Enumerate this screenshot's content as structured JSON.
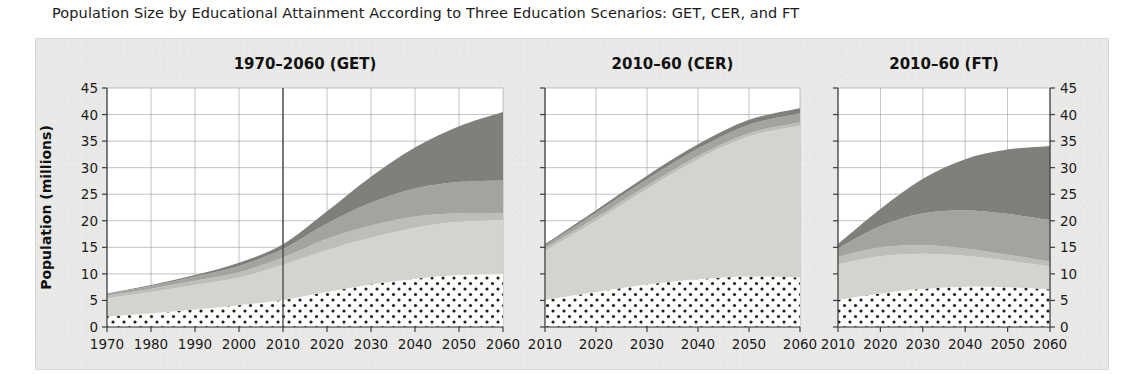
{
  "figure": {
    "title": "Population Size by Educational Attainment According to Three Education Scenarios: GET, CER, and FT",
    "ylabel": "Population (millions)",
    "background_color": "#e9e9e7",
    "frame_color": "#d6d6d3",
    "grid_color": "#9a9a9a"
  },
  "panels": [
    {
      "id": "get",
      "title": "1970–2060 (GET)"
    },
    {
      "id": "cer",
      "title": "2010–60 (CER)"
    },
    {
      "id": "ft",
      "title": "2010–60 (FT)"
    }
  ],
  "axis": {
    "y_ticks": [
      "0",
      "5",
      "10",
      "15",
      "20",
      "25",
      "30",
      "35",
      "40",
      "45"
    ],
    "x_ticks_panel1": [
      "1970",
      "1980",
      "1990",
      "2000",
      "2010",
      "2020",
      "2030",
      "2040",
      "2050",
      "2060"
    ],
    "x_ticks_panel2": [
      "2010",
      "2020",
      "2030",
      "2040",
      "2050",
      "2060"
    ],
    "x_ticks_panel3": [
      "2010",
      "2020",
      "2030",
      "2040",
      "2050",
      "2060"
    ]
  },
  "chart_data": {
    "type": "area",
    "title": "Population Size by Educational Attainment According to Three Education Scenarios: GET, CER, and FT",
    "xlabel": "",
    "ylabel": "Population (millions)",
    "ylim": [
      0,
      45
    ],
    "grid": true,
    "legend_position": "none",
    "stacked": true,
    "series_order_bottom_to_top": [
      "No Education",
      "Primary",
      "Lower Secondary",
      "Upper Secondary",
      "Post-Secondary"
    ],
    "series_colors": {
      "No Education": "#fbfbf9",
      "Primary": "#d3d3d0",
      "Lower Secondary": "#bdbdba",
      "Upper Secondary": "#a3a3a0",
      "Post-Secondary": "#7f7f7c"
    },
    "panels": [
      {
        "name": "1970-2060 (GET)",
        "x": [
          1970,
          1980,
          1990,
          2000,
          2010,
          2020,
          2030,
          2040,
          2050,
          2060
        ],
        "xlim": [
          1970,
          2060
        ],
        "vertical_reference_line_at": 2010,
        "series": [
          {
            "name": "No Education",
            "values": [
              2.0,
              2.6,
              3.3,
              4.1,
              5.1,
              6.6,
              8.0,
              9.1,
              9.8,
              10.0
            ]
          },
          {
            "name": "Primary",
            "values": [
              3.4,
              4.0,
              4.6,
              5.2,
              6.6,
              7.9,
              8.8,
              9.6,
              10.0,
              10.2
            ]
          },
          {
            "name": "Lower Secondary",
            "values": [
              0.5,
              0.6,
              0.8,
              1.0,
              1.4,
              2.1,
              2.3,
              2.1,
              1.6,
              1.2
            ]
          },
          {
            "name": "Upper Secondary",
            "values": [
              0.3,
              0.5,
              0.8,
              1.2,
              1.6,
              2.9,
              4.3,
              5.3,
              5.9,
              6.2
            ]
          },
          {
            "name": "Post-Secondary",
            "values": [
              0.1,
              0.2,
              0.3,
              0.6,
              0.9,
              2.3,
              4.9,
              7.7,
              10.5,
              12.9
            ]
          }
        ],
        "totals": [
          6.3,
          7.9,
          9.8,
          12.1,
          15.6,
          21.8,
          28.3,
          33.8,
          37.8,
          40.5
        ]
      },
      {
        "name": "2010-60 (CER)",
        "x": [
          2010,
          2020,
          2030,
          2040,
          2050,
          2060
        ],
        "xlim": [
          2010,
          2060
        ],
        "series": [
          {
            "name": "No Education",
            "values": [
              5.1,
              6.6,
              8.0,
              9.0,
              9.5,
              9.3
            ]
          },
          {
            "name": "Primary",
            "values": [
              9.2,
              13.4,
              18.0,
              22.6,
              26.4,
              28.6
            ]
          },
          {
            "name": "Lower Secondary",
            "values": [
              0.5,
              0.6,
              0.6,
              0.6,
              0.6,
              0.6
            ]
          },
          {
            "name": "Upper Secondary",
            "values": [
              0.5,
              0.9,
              1.2,
              1.4,
              1.6,
              1.7
            ]
          },
          {
            "name": "Post-Secondary",
            "values": [
              0.3,
              0.5,
              0.7,
              0.8,
              0.9,
              1.0
            ]
          }
        ],
        "totals": [
          15.6,
          22.0,
          28.5,
          34.4,
          39.0,
          41.2
        ]
      },
      {
        "name": "2010-60 (FT)",
        "x": [
          2010,
          2020,
          2030,
          2040,
          2050,
          2060
        ],
        "xlim": [
          2010,
          2060
        ],
        "series": [
          {
            "name": "No Education",
            "values": [
              5.1,
              6.3,
              7.2,
              7.6,
              7.5,
              7.1
            ]
          },
          {
            "name": "Primary",
            "values": [
              6.7,
              7.0,
              6.6,
              5.8,
              5.0,
              4.3
            ]
          },
          {
            "name": "Lower Secondary",
            "values": [
              1.4,
              1.7,
              1.6,
              1.4,
              1.1,
              0.9
            ]
          },
          {
            "name": "Upper Secondary",
            "values": [
              1.6,
              4.0,
              6.0,
              7.2,
              7.7,
              7.8
            ]
          },
          {
            "name": "Post-Secondary",
            "values": [
              0.8,
              3.2,
              6.5,
              9.6,
              12.1,
              14.0
            ]
          }
        ],
        "totals": [
          15.6,
          22.2,
          27.9,
          31.6,
          33.4,
          34.1
        ]
      }
    ]
  }
}
